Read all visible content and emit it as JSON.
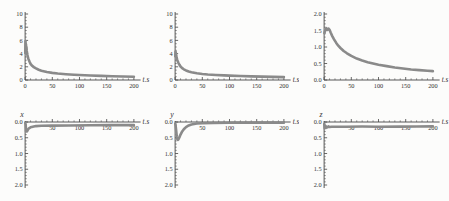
{
  "figure": {
    "time_axis_label": "t.s"
  },
  "colors": {
    "background": "#fcfcfb",
    "axis": "#454545",
    "curve": "#8a8a8a",
    "text": "#333333"
  },
  "chart_data": [
    {
      "type": "line",
      "corner_label": "",
      "xlabel": "t.s",
      "orientation": "normal",
      "xlim": [
        0,
        205
      ],
      "ylim": [
        0,
        10
      ],
      "x_ticks": [
        {
          "v": 0,
          "l": "0"
        },
        {
          "v": 50,
          "l": "50"
        },
        {
          "v": 100,
          "l": "100"
        },
        {
          "v": 150,
          "l": "150"
        },
        {
          "v": 200,
          "l": "200"
        }
      ],
      "x_minor_step": 10,
      "y_ticks": [
        {
          "v": 0,
          "l": "0"
        },
        {
          "v": 2,
          "l": "2"
        },
        {
          "v": 4,
          "l": "4"
        },
        {
          "v": 6,
          "l": "6"
        },
        {
          "v": 8,
          "l": "8"
        },
        {
          "v": 10,
          "l": "10"
        }
      ],
      "y_minor_step": 0.5,
      "points": [
        [
          0.3,
          4.1
        ],
        [
          0.8,
          5.9
        ],
        [
          1.2,
          4.3
        ],
        [
          1.6,
          5.4
        ],
        [
          2,
          4.6
        ],
        [
          2.5,
          5.0
        ],
        [
          3,
          4.4
        ],
        [
          4,
          3.9
        ],
        [
          5,
          3.5
        ],
        [
          6,
          3.2
        ],
        [
          8,
          2.8
        ],
        [
          10,
          2.45
        ],
        [
          13,
          2.15
        ],
        [
          16,
          1.95
        ],
        [
          20,
          1.75
        ],
        [
          25,
          1.55
        ],
        [
          30,
          1.4
        ],
        [
          40,
          1.2
        ],
        [
          50,
          1.08
        ],
        [
          60,
          0.98
        ],
        [
          75,
          0.88
        ],
        [
          90,
          0.8
        ],
        [
          100,
          0.76
        ],
        [
          120,
          0.68
        ],
        [
          140,
          0.62
        ],
        [
          160,
          0.57
        ],
        [
          180,
          0.53
        ],
        [
          200,
          0.5
        ]
      ]
    },
    {
      "type": "line",
      "corner_label": "",
      "xlabel": "t.s",
      "orientation": "normal",
      "xlim": [
        0,
        205
      ],
      "ylim": [
        0,
        10
      ],
      "x_ticks": [
        {
          "v": 0,
          "l": "0"
        },
        {
          "v": 50,
          "l": "50"
        },
        {
          "v": 100,
          "l": "100"
        },
        {
          "v": 150,
          "l": "150"
        },
        {
          "v": 200,
          "l": "200"
        }
      ],
      "x_minor_step": 10,
      "y_ticks": [
        {
          "v": 0,
          "l": "0"
        },
        {
          "v": 2,
          "l": "2"
        },
        {
          "v": 4,
          "l": "4"
        },
        {
          "v": 6,
          "l": "6"
        },
        {
          "v": 8,
          "l": "8"
        },
        {
          "v": 10,
          "l": "10"
        }
      ],
      "y_minor_step": 0.5,
      "points": [
        [
          0.3,
          3.6
        ],
        [
          0.8,
          4.3
        ],
        [
          1.5,
          4.0
        ],
        [
          2,
          3.7
        ],
        [
          3,
          3.3
        ],
        [
          4,
          3.0
        ],
        [
          5,
          2.8
        ],
        [
          6,
          2.6
        ],
        [
          8,
          2.3
        ],
        [
          10,
          2.05
        ],
        [
          13,
          1.8
        ],
        [
          16,
          1.62
        ],
        [
          20,
          1.45
        ],
        [
          25,
          1.3
        ],
        [
          30,
          1.18
        ],
        [
          40,
          1.02
        ],
        [
          50,
          0.92
        ],
        [
          60,
          0.84
        ],
        [
          75,
          0.76
        ],
        [
          90,
          0.7
        ],
        [
          100,
          0.66
        ],
        [
          120,
          0.6
        ],
        [
          140,
          0.55
        ],
        [
          160,
          0.51
        ],
        [
          180,
          0.47
        ],
        [
          200,
          0.44
        ]
      ]
    },
    {
      "type": "line",
      "corner_label": "",
      "xlabel": "t.s",
      "orientation": "normal",
      "xlim": [
        0,
        205
      ],
      "ylim": [
        0,
        2
      ],
      "x_ticks": [
        {
          "v": 0,
          "l": "0"
        },
        {
          "v": 50,
          "l": "50"
        },
        {
          "v": 100,
          "l": "100"
        },
        {
          "v": 150,
          "l": "150"
        },
        {
          "v": 200,
          "l": "200"
        }
      ],
      "x_minor_step": 10,
      "y_ticks": [
        {
          "v": 0,
          "l": "0.0"
        },
        {
          "v": 0.5,
          "l": "0.5"
        },
        {
          "v": 1,
          "l": "1.0"
        },
        {
          "v": 1.5,
          "l": "1.5"
        },
        {
          "v": 2,
          "l": "2.0"
        }
      ],
      "y_minor_step": 0.1,
      "points": [
        [
          0.5,
          1.42
        ],
        [
          2,
          1.5
        ],
        [
          4,
          1.57
        ],
        [
          6,
          1.52
        ],
        [
          8,
          1.56
        ],
        [
          10,
          1.52
        ],
        [
          12,
          1.44
        ],
        [
          15,
          1.33
        ],
        [
          18,
          1.24
        ],
        [
          22,
          1.13
        ],
        [
          26,
          1.04
        ],
        [
          30,
          0.97
        ],
        [
          36,
          0.88
        ],
        [
          42,
          0.81
        ],
        [
          50,
          0.73
        ],
        [
          60,
          0.65
        ],
        [
          70,
          0.59
        ],
        [
          80,
          0.54
        ],
        [
          90,
          0.5
        ],
        [
          100,
          0.46
        ],
        [
          115,
          0.42
        ],
        [
          130,
          0.38
        ],
        [
          145,
          0.35
        ],
        [
          160,
          0.32
        ],
        [
          175,
          0.3
        ],
        [
          190,
          0.28
        ],
        [
          200,
          0.27
        ]
      ]
    },
    {
      "type": "line",
      "corner_label": "x",
      "xlabel": "t.s",
      "orientation": "inverted",
      "xlim": [
        0,
        205
      ],
      "ylim": [
        0,
        2
      ],
      "x_ticks": [
        {
          "v": 50,
          "l": "50"
        },
        {
          "v": 100,
          "l": "100"
        },
        {
          "v": 150,
          "l": "150"
        },
        {
          "v": 200,
          "l": "200"
        }
      ],
      "x_minor_step": 10,
      "y_ticks": [
        {
          "v": 0,
          "l": "0.0"
        },
        {
          "v": 0.5,
          "l": "0.5"
        },
        {
          "v": 1,
          "l": "1.0"
        },
        {
          "v": 1.5,
          "l": "1.5"
        },
        {
          "v": 2,
          "l": "2.0"
        }
      ],
      "y_minor_step": 0.1,
      "points": [
        [
          0.3,
          0.03
        ],
        [
          1,
          0.08
        ],
        [
          1.8,
          0.3
        ],
        [
          2.5,
          0.27
        ],
        [
          3.5,
          0.3
        ],
        [
          5,
          0.25
        ],
        [
          7,
          0.2
        ],
        [
          10,
          0.17
        ],
        [
          14,
          0.15
        ],
        [
          20,
          0.13
        ],
        [
          30,
          0.12
        ],
        [
          50,
          0.115
        ],
        [
          80,
          0.11
        ],
        [
          120,
          0.105
        ],
        [
          160,
          0.1
        ],
        [
          200,
          0.1
        ]
      ]
    },
    {
      "type": "line",
      "corner_label": "y",
      "xlabel": "t.s",
      "orientation": "inverted",
      "xlim": [
        0,
        205
      ],
      "ylim": [
        0,
        2
      ],
      "x_ticks": [
        {
          "v": 50,
          "l": "50"
        },
        {
          "v": 100,
          "l": "100"
        },
        {
          "v": 150,
          "l": "150"
        },
        {
          "v": 200,
          "l": "200"
        }
      ],
      "x_minor_step": 10,
      "y_ticks": [
        {
          "v": 0,
          "l": "0.0"
        },
        {
          "v": 0.5,
          "l": "0.5"
        },
        {
          "v": 1,
          "l": "1.0"
        },
        {
          "v": 1.5,
          "l": "1.5"
        },
        {
          "v": 2,
          "l": "2.0"
        }
      ],
      "y_minor_step": 0.1,
      "points": [
        [
          0.3,
          0.05
        ],
        [
          1,
          0.12
        ],
        [
          2,
          0.28
        ],
        [
          3,
          0.45
        ],
        [
          4,
          0.54
        ],
        [
          5,
          0.57
        ],
        [
          6,
          0.55
        ],
        [
          8,
          0.48
        ],
        [
          10,
          0.4
        ],
        [
          13,
          0.3
        ],
        [
          16,
          0.23
        ],
        [
          20,
          0.16
        ],
        [
          25,
          0.11
        ],
        [
          30,
          0.08
        ],
        [
          40,
          0.05
        ],
        [
          50,
          0.04
        ],
        [
          70,
          0.03
        ],
        [
          100,
          0.025
        ],
        [
          150,
          0.02
        ],
        [
          200,
          0.02
        ]
      ]
    },
    {
      "type": "line",
      "corner_label": "z",
      "xlabel": "t.s",
      "orientation": "inverted",
      "xlim": [
        0,
        205
      ],
      "ylim": [
        0,
        2
      ],
      "x_ticks": [
        {
          "v": 50,
          "l": "50"
        },
        {
          "v": 100,
          "l": "100"
        },
        {
          "v": 150,
          "l": "150"
        },
        {
          "v": 200,
          "l": "200"
        }
      ],
      "x_minor_step": 10,
      "y_ticks": [
        {
          "v": 0,
          "l": "0.0"
        },
        {
          "v": 0.5,
          "l": "0.5"
        },
        {
          "v": 1,
          "l": "1.0"
        },
        {
          "v": 1.5,
          "l": "1.5"
        },
        {
          "v": 2,
          "l": "2.0"
        }
      ],
      "y_minor_step": 0.1,
      "points": [
        [
          0.3,
          0.06
        ],
        [
          1,
          0.2
        ],
        [
          2,
          0.12
        ],
        [
          3,
          0.19
        ],
        [
          4,
          0.14
        ],
        [
          6,
          0.17
        ],
        [
          8,
          0.14
        ],
        [
          10,
          0.16
        ],
        [
          14,
          0.15
        ],
        [
          20,
          0.15
        ],
        [
          40,
          0.15
        ],
        [
          70,
          0.145
        ],
        [
          100,
          0.15
        ],
        [
          140,
          0.147
        ],
        [
          170,
          0.145
        ],
        [
          200,
          0.14
        ]
      ]
    }
  ]
}
